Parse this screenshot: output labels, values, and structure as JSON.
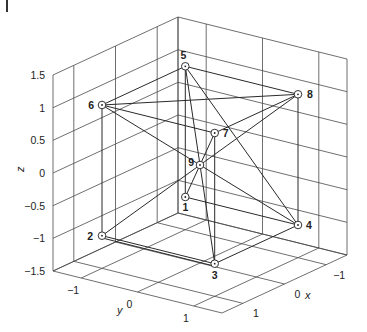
{
  "chart_data": {
    "type": "scatter3d-graph",
    "title": "",
    "xlabel": "x",
    "ylabel": "y",
    "zlabel": "z",
    "xlim": [
      -1.5,
      1.5
    ],
    "ylim": [
      -1.5,
      1.5
    ],
    "zlim": [
      -1.5,
      1.5
    ],
    "grid": true,
    "x_ticks": [
      -1,
      0,
      1
    ],
    "y_ticks": [
      -1,
      0,
      1
    ],
    "z_ticks": [
      -1.5,
      -1,
      -0.5,
      0,
      0.5,
      1,
      1.5
    ],
    "x_tick_labels": [
      "−1",
      "0",
      "1"
    ],
    "y_tick_labels": [
      "−1",
      "0",
      "1"
    ],
    "z_tick_labels": [
      "−1.5",
      "−1",
      "−0.5",
      "0",
      "0.5",
      "1",
      "1.5"
    ],
    "nodes": [
      {
        "id": "1",
        "x": -1,
        "y": -1,
        "z": -1
      },
      {
        "id": "2",
        "x": 1,
        "y": -1,
        "z": -1
      },
      {
        "id": "3",
        "x": 1,
        "y": 1,
        "z": -1
      },
      {
        "id": "4",
        "x": -1,
        "y": 1,
        "z": -1
      },
      {
        "id": "5",
        "x": -1,
        "y": -1,
        "z": 1
      },
      {
        "id": "6",
        "x": 1,
        "y": -1,
        "z": 1
      },
      {
        "id": "7",
        "x": 1,
        "y": 1,
        "z": 1
      },
      {
        "id": "8",
        "x": -1,
        "y": 1,
        "z": 1
      },
      {
        "id": "9",
        "x": 0,
        "y": 0,
        "z": 0
      }
    ],
    "edges": [
      [
        "5",
        "6"
      ],
      [
        "5",
        "8"
      ],
      [
        "5",
        "1"
      ],
      [
        "5",
        "3"
      ],
      [
        "5",
        "4"
      ],
      [
        "6",
        "8"
      ],
      [
        "6",
        "2"
      ],
      [
        "6",
        "7"
      ],
      [
        "6",
        "9"
      ],
      [
        "9",
        "4"
      ],
      [
        "8",
        "4"
      ],
      [
        "8",
        "9"
      ],
      [
        "9",
        "2"
      ],
      [
        "8",
        "7"
      ],
      [
        "7",
        "3"
      ],
      [
        "7",
        "9"
      ],
      [
        "9",
        "1"
      ],
      [
        "1",
        "4"
      ],
      [
        "2",
        "3"
      ],
      [
        "3",
        "4"
      ]
    ]
  },
  "corner_mark": "|"
}
